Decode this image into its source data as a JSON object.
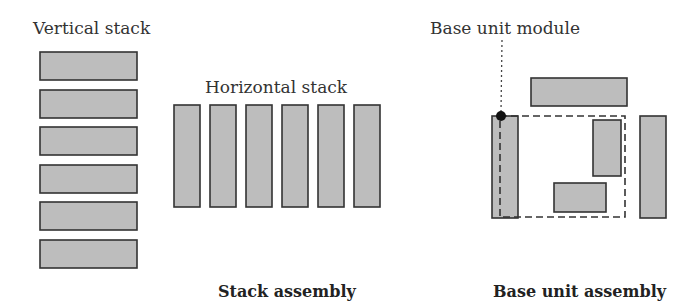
{
  "colors": {
    "bar_fill": "#bdbdbd",
    "bar_stroke": "#333333",
    "background": "#ffffff",
    "text": "#333333"
  },
  "labels": {
    "vertical_stack": "Vertical stack",
    "horizontal_stack": "Horizontal stack",
    "base_unit_module": "Base unit module",
    "stack_assembly": "Stack assembly",
    "base_unit_assembly": "Base unit assembly"
  },
  "vertical_stack": {
    "x": 40,
    "width": 97,
    "height": 28,
    "ys": [
      52,
      90,
      127,
      165,
      202,
      240
    ]
  },
  "horizontal_stack": {
    "y": 105,
    "width": 26,
    "height": 102,
    "xs": [
      174,
      210,
      246,
      282,
      318,
      354
    ]
  },
  "base_unit": {
    "top_bar": {
      "x": 531,
      "y": 78,
      "w": 96,
      "h": 28
    },
    "left_pillar": {
      "x": 492,
      "y": 116,
      "w": 26,
      "h": 102
    },
    "right_pillar": {
      "x": 640,
      "y": 116,
      "w": 26,
      "h": 102
    },
    "dashed_box": {
      "x": 500,
      "y": 116,
      "w": 125,
      "h": 101
    },
    "inner_vertical": {
      "x": 593,
      "y": 120,
      "w": 28,
      "h": 56
    },
    "inner_horizontal": {
      "x": 554,
      "y": 183,
      "w": 52,
      "h": 29
    },
    "dot": {
      "cx": 501,
      "cy": 116,
      "r": 5
    },
    "leader": {
      "x1": 502,
      "y1": 40,
      "x2": 501,
      "y2": 112
    }
  }
}
